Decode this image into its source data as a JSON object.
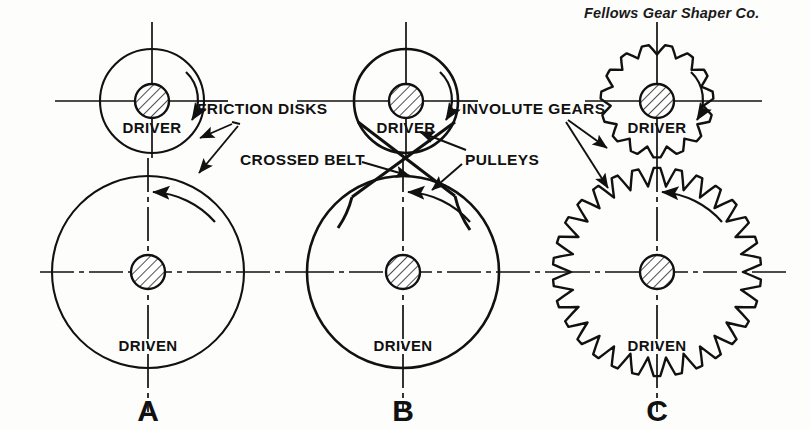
{
  "figure": {
    "credit": "Fellows Gear Shaper Co.",
    "background_color": "#fdfdfc",
    "ink_color": "#111111"
  },
  "callouts": [
    {
      "id": "friction-disks",
      "text": "FRICTION DISKS",
      "x": 197,
      "y": 101
    },
    {
      "id": "crossed-belt",
      "text": "CROSSED BELT",
      "x": 240,
      "y": 152
    },
    {
      "id": "involute-gears",
      "text": "INVOLUTE GEARS",
      "x": 462,
      "y": 101
    },
    {
      "id": "pulleys",
      "text": "PULLEYS",
      "x": 465,
      "y": 152
    }
  ],
  "diagrams": [
    {
      "id": "a",
      "caption": "A",
      "caption_x": 148,
      "caption_y": 396,
      "type": "friction-disks",
      "driver": {
        "label": "DRIVER",
        "label_x": 152,
        "label_y": 120,
        "cx": 152,
        "cy": 101,
        "radius": 52,
        "hub_radius": 17,
        "rotation": "clockwise"
      },
      "driven": {
        "label": "DRIVEN",
        "label_x": 148,
        "label_y": 338,
        "cx": 148,
        "cy": 272,
        "radius": 96,
        "hub_radius": 17,
        "rotation": "counterclockwise"
      }
    },
    {
      "id": "b",
      "caption": "B",
      "caption_x": 403,
      "caption_y": 396,
      "type": "crossed-belt-pulleys",
      "driver": {
        "label": "DRIVER",
        "label_x": 406,
        "label_y": 120,
        "cx": 406,
        "cy": 101,
        "radius": 52,
        "hub_radius": 17,
        "rotation": "clockwise"
      },
      "driven": {
        "label": "DRIVEN",
        "label_x": 403,
        "label_y": 338,
        "cx": 403,
        "cy": 272,
        "radius": 96,
        "hub_radius": 17,
        "rotation": "counterclockwise"
      }
    },
    {
      "id": "c",
      "caption": "C",
      "caption_x": 657,
      "caption_y": 396,
      "type": "involute-gears",
      "driver": {
        "label": "DRIVER",
        "label_x": 657,
        "label_y": 120,
        "cx": 657,
        "cy": 101,
        "radius": 52,
        "hub_radius": 17,
        "teeth": 15,
        "rotation": "clockwise"
      },
      "driven": {
        "label": "DRIVEN",
        "label_x": 657,
        "label_y": 338,
        "cx": 657,
        "cy": 272,
        "radius": 96,
        "hub_radius": 17,
        "teeth": 30,
        "rotation": "counterclockwise"
      }
    }
  ],
  "centerlines": {
    "upper_y": 101,
    "lower_y": 272,
    "x_start": 55,
    "x_end": 762
  }
}
